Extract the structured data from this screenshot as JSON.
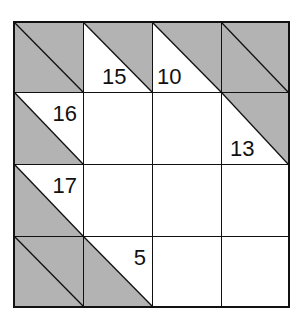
{
  "puzzle": {
    "type": "kakuro",
    "rows": 4,
    "cols": 4,
    "colors": {
      "block": "#b3b3b3",
      "line": "#111111",
      "empty": "#ffffff"
    },
    "cells": [
      [
        {
          "kind": "block"
        },
        {
          "kind": "clue",
          "down": "15",
          "right": ""
        },
        {
          "kind": "clue",
          "down": "10",
          "right": ""
        },
        {
          "kind": "block"
        }
      ],
      [
        {
          "kind": "clue",
          "down": "",
          "right": "16"
        },
        {
          "kind": "empty"
        },
        {
          "kind": "empty"
        },
        {
          "kind": "clue",
          "down": "13",
          "right": ""
        }
      ],
      [
        {
          "kind": "clue",
          "down": "",
          "right": "17"
        },
        {
          "kind": "empty"
        },
        {
          "kind": "empty"
        },
        {
          "kind": "empty"
        }
      ],
      [
        {
          "kind": "block"
        },
        {
          "kind": "clue",
          "down": "",
          "right": "5"
        },
        {
          "kind": "empty"
        },
        {
          "kind": "empty"
        }
      ]
    ]
  }
}
